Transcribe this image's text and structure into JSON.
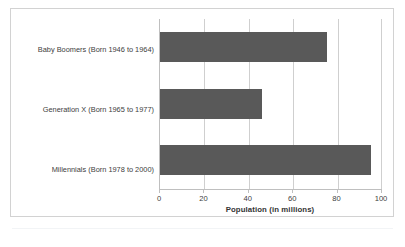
{
  "chart_data": {
    "type": "bar",
    "orientation": "horizontal",
    "title": "",
    "categories": [
      "Baby Boomers (Born 1946 to 1964)",
      "Generation X (Born 1965 to 1977)",
      "Millennials (Born 1978 to 2000)"
    ],
    "values": [
      75,
      46,
      95
    ],
    "xlabel": "Population (in millions)",
    "ylabel": "",
    "xlim": [
      0,
      100
    ],
    "xticks": [
      0,
      20,
      40,
      60,
      80,
      100
    ],
    "xtick_labels": [
      "0",
      "20",
      "40",
      "60",
      "80",
      "100"
    ],
    "grid": "vertical",
    "legend": "none",
    "bar_color": "#595959",
    "gridline_color": "#cfcfcf",
    "axis_color": "#bfbfbf",
    "frame_color": "#d2d2d2"
  },
  "figure": {
    "caption": ""
  }
}
